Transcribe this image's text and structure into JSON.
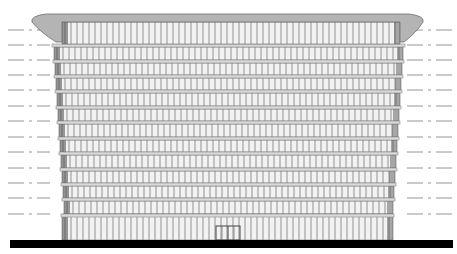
{
  "drawing": {
    "type": "building-elevation",
    "width": 457,
    "height": 254,
    "colors": {
      "background": "#ffffff",
      "ground": "#000000",
      "roof_cap": "#b4b4b4",
      "roof_cap_stroke": "#6e6e6e",
      "floor_band": "#d9d9d9",
      "floor_band_stroke": "#8a8a8a",
      "glazing": "#f2f2f2",
      "mullion": "#6a6a6a",
      "edge_shade": "#4a4a4a",
      "level_line": "#7a7a7a"
    },
    "ground": {
      "x1": 10,
      "x2": 453,
      "y": 240,
      "h": 8
    },
    "roof": {
      "cap_top": 14,
      "cap_bottom": 22,
      "cap_left": 32,
      "cap_right": 423,
      "penthouse_left": 62,
      "penthouse_right": 400,
      "penthouse_top": 22,
      "penthouse_bottom": 44
    },
    "level_lines_y": [
      30,
      45,
      60,
      75,
      90,
      106,
      121,
      137,
      152,
      168,
      183,
      198,
      214
    ],
    "floors": [
      {
        "top": 44,
        "bottom": 60,
        "left": 52,
        "right": 405
      },
      {
        "top": 60,
        "bottom": 75,
        "left": 53,
        "right": 404
      },
      {
        "top": 75,
        "bottom": 90,
        "left": 54,
        "right": 403
      },
      {
        "top": 90,
        "bottom": 106,
        "left": 55,
        "right": 402
      },
      {
        "top": 106,
        "bottom": 121,
        "left": 56,
        "right": 401
      },
      {
        "top": 121,
        "bottom": 137,
        "left": 57,
        "right": 400
      },
      {
        "top": 137,
        "bottom": 152,
        "left": 58,
        "right": 399
      },
      {
        "top": 152,
        "bottom": 168,
        "left": 59,
        "right": 398
      },
      {
        "top": 168,
        "bottom": 183,
        "left": 60,
        "right": 397
      },
      {
        "top": 183,
        "bottom": 198,
        "left": 61,
        "right": 396
      },
      {
        "top": 198,
        "bottom": 214,
        "left": 62,
        "right": 395
      }
    ],
    "ground_floor": {
      "top": 214,
      "bottom": 240,
      "left": 62,
      "right": 393
    },
    "entrance": {
      "x": 216,
      "y": 226,
      "w": 24,
      "h": 14
    },
    "mullion_spacing": 6
  }
}
